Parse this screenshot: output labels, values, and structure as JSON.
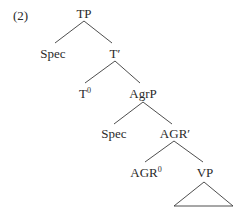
{
  "example_number": "(2)",
  "tree": {
    "root": "TP",
    "nodes": {
      "tp": {
        "label": "TP"
      },
      "spec_tp": {
        "label": "Spec"
      },
      "t_bar": {
        "label": "T′"
      },
      "t_head": {
        "label": "T",
        "superscript": "0"
      },
      "agrp": {
        "label": "AgrP"
      },
      "spec_agrp": {
        "label": "Spec"
      },
      "agr_bar": {
        "label": "AGR′"
      },
      "agr_head": {
        "label": "AGR",
        "superscript": "0"
      },
      "vp": {
        "label": "VP"
      }
    },
    "edges": [
      [
        "TP",
        "Spec"
      ],
      [
        "TP",
        "T′"
      ],
      [
        "T′",
        "T0"
      ],
      [
        "T′",
        "AgrP"
      ],
      [
        "AgrP",
        "Spec"
      ],
      [
        "AgrP",
        "AGR′"
      ],
      [
        "AGR′",
        "AGR0"
      ],
      [
        "AGR′",
        "VP"
      ]
    ],
    "vp_subtree": "triangle"
  },
  "colors": {
    "line": "#3a3a3a",
    "text": "#2a2a2a"
  }
}
